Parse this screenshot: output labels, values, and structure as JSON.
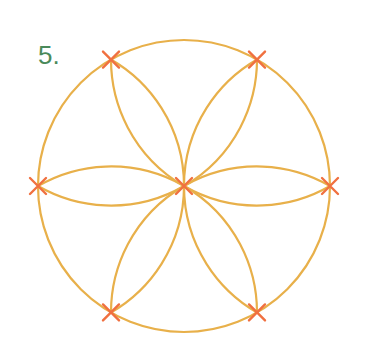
{
  "step_label": "5.",
  "diagram": {
    "center": [
      184,
      186
    ],
    "radius": 146,
    "line_color": "#e8b04a",
    "marker_color": "#f07040",
    "points_angles_deg": [
      0,
      60,
      120,
      180,
      240,
      300
    ],
    "marker_icon": "cross-marker"
  }
}
